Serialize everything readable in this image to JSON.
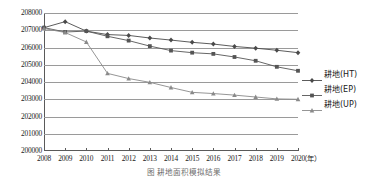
{
  "chart_data": {
    "type": "line",
    "title": "",
    "xlabel": "年",
    "ylabel": "",
    "categories": [
      2008,
      2009,
      2010,
      2011,
      2012,
      2013,
      2014,
      2015,
      2016,
      2017,
      2018,
      2019,
      2020
    ],
    "xtick_labels": [
      "2008",
      "2009",
      "2010",
      "2011",
      "2012",
      "2013",
      "2014",
      "2015",
      "2016",
      "2017",
      "2018",
      "2019",
      "2020"
    ],
    "ytick_labels": [
      "208000",
      "207000",
      "206000",
      "205000",
      "204000",
      "203000",
      "202000",
      "201000",
      "200000"
    ],
    "ytick_values": [
      208000,
      207000,
      206000,
      205000,
      204000,
      203000,
      202000,
      201000,
      200000
    ],
    "ylim": [
      200000,
      208000
    ],
    "grid": true,
    "legend_position": "right",
    "series": [
      {
        "name": "耕地(HT)",
        "marker": "diamond",
        "color": "#4a4a4a",
        "values": [
          207150,
          207500,
          206950,
          206750,
          206700,
          206550,
          206430,
          206300,
          206200,
          206060,
          205960,
          205840,
          205700
        ]
      },
      {
        "name": "耕地(EP)",
        "marker": "square",
        "color": "#555555",
        "values": [
          207150,
          206900,
          206950,
          206650,
          206400,
          206080,
          205820,
          205700,
          205630,
          205450,
          205230,
          204880,
          204650
        ]
      },
      {
        "name": "耕地(UP)",
        "marker": "triangle",
        "color": "#8a8a8a",
        "values": [
          207100,
          206870,
          206320,
          204500,
          204200,
          203980,
          203680,
          203400,
          203330,
          203240,
          203130,
          203020,
          203000
        ]
      }
    ]
  },
  "axis": {
    "x_unit_label": "（年）"
  },
  "legend": {
    "items": [
      {
        "label": "耕地(HT)"
      },
      {
        "label": "耕地(EP)"
      },
      {
        "label": "耕地(UP)"
      }
    ]
  },
  "caption": {
    "text": "图  耕地面积模拟结果"
  }
}
